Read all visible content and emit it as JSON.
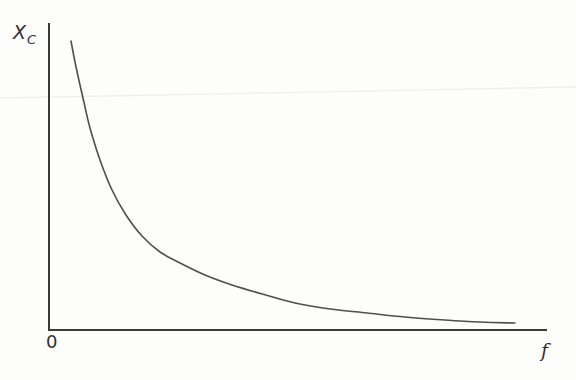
{
  "chart_data": {
    "type": "line",
    "title": "",
    "xlabel": "f",
    "ylabel": "X_C",
    "labels": {
      "y_axis_main": "X",
      "y_axis_sub": "C",
      "origin": "0",
      "x_axis": "f"
    },
    "curve_shape": "hyperbolic decay (X_C decreases as f increases, asymptotic to both axes)",
    "axis_ticks": "none (qualitative sketch, no numeric scale)",
    "legend": "none",
    "grid": false,
    "axes_px": {
      "y_axis": {
        "x": 49,
        "y_top": 23,
        "y_bottom": 331
      },
      "x_axis": {
        "y": 330,
        "x_left": 48,
        "x_right": 547
      }
    },
    "curve_points_px": [
      [
        71,
        41
      ],
      [
        75,
        62
      ],
      [
        80,
        85
      ],
      [
        85,
        107
      ],
      [
        90,
        128
      ],
      [
        100,
        160
      ],
      [
        112,
        190
      ],
      [
        126,
        215
      ],
      [
        142,
        236
      ],
      [
        160,
        252
      ],
      [
        180,
        263
      ],
      [
        205,
        275
      ],
      [
        232,
        285
      ],
      [
        262,
        294
      ],
      [
        295,
        303
      ],
      [
        330,
        309
      ],
      [
        367,
        313
      ],
      [
        405,
        317
      ],
      [
        445,
        320
      ],
      [
        480,
        322
      ],
      [
        515,
        323
      ]
    ],
    "artifact_line_px": {
      "x1": 0,
      "y1": 98,
      "x2": 576,
      "y2": 87
    },
    "colors": {
      "background": "#fdfdfc",
      "axis": "#3a3a3a",
      "curve": "#4f4f4f",
      "label": "#2f2f2f",
      "scan_artifact": "#efefec"
    }
  }
}
